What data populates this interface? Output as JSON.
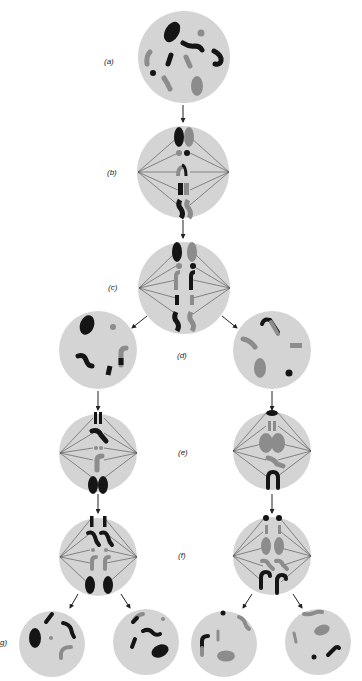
{
  "figure": {
    "labels": {
      "a": "(a)",
      "b": "(b)",
      "c": "(c)",
      "d": "(d)",
      "e": "(e)",
      "f": "(f)",
      "g": "g)"
    }
  },
  "colors": {
    "background": "#ffffff",
    "cell_fill": "#d4d4d4",
    "maternal_chromosome": "#151515",
    "paternal_chromosome": "#8c8c8c",
    "spindle": "#4a4a4a",
    "arrow": "#222222",
    "label_text": "#222222"
  },
  "stages": [
    {
      "id": "a",
      "name": "prophase-I-cell",
      "spindle": false
    },
    {
      "id": "b",
      "name": "metaphase-I-cell",
      "spindle": true
    },
    {
      "id": "c",
      "name": "anaphase-I-cell",
      "spindle": true
    },
    {
      "id": "d-left",
      "name": "daughter-cell-left",
      "spindle": false
    },
    {
      "id": "d-right",
      "name": "daughter-cell-right",
      "spindle": false
    },
    {
      "id": "e-left",
      "name": "metaphase-II-cell-left",
      "spindle": true
    },
    {
      "id": "e-right",
      "name": "metaphase-II-cell-right",
      "spindle": true
    },
    {
      "id": "f-left",
      "name": "anaphase-II-cell-left",
      "spindle": true
    },
    {
      "id": "f-right",
      "name": "anaphase-II-cell-right",
      "spindle": true
    },
    {
      "id": "g-1",
      "name": "gamete-cell-1",
      "spindle": false
    },
    {
      "id": "g-2",
      "name": "gamete-cell-2",
      "spindle": false
    },
    {
      "id": "g-3",
      "name": "gamete-cell-3",
      "spindle": false
    },
    {
      "id": "g-4",
      "name": "gamete-cell-4",
      "spindle": false
    }
  ]
}
